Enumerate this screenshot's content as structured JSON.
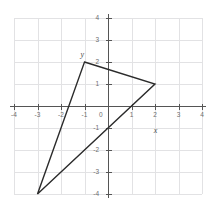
{
  "chart_data": {
    "type": "scatter",
    "title": "",
    "subtitle": "",
    "xlabel": "x",
    "ylabel": "y",
    "xlim": [
      -4,
      4
    ],
    "ylim": [
      -4,
      4
    ],
    "grid": true,
    "legend": null,
    "x_ticks": [
      "-4",
      "-3",
      "-2",
      "-1",
      "0",
      "1",
      "2",
      "3",
      "4"
    ],
    "x_tick_values": [
      -4,
      -3,
      -2,
      -1,
      0,
      1,
      2,
      3,
      4
    ],
    "y_ticks": [
      "4",
      "3",
      "2",
      "1",
      "-1",
      "-2",
      "-3",
      "-4"
    ],
    "y_tick_values": [
      4,
      3,
      2,
      1,
      -1,
      -2,
      -3,
      -4
    ],
    "origin_label": "0",
    "shapes": [
      {
        "name": "triangle",
        "kind": "polygon",
        "closed": true,
        "points": [
          {
            "x": -1,
            "y": 2
          },
          {
            "x": 2,
            "y": 1
          },
          {
            "x": -3,
            "y": -4
          }
        ],
        "stroke": "#2b2b2b",
        "fill": "none"
      }
    ],
    "colors": {
      "grid": "#e2e2e4",
      "axis": "#555555",
      "tick_text": "#6d6d6d",
      "shape_stroke": "#2b2b2b",
      "background": "#ffffff"
    }
  },
  "axis_names": {
    "x": "x",
    "y": "y"
  }
}
